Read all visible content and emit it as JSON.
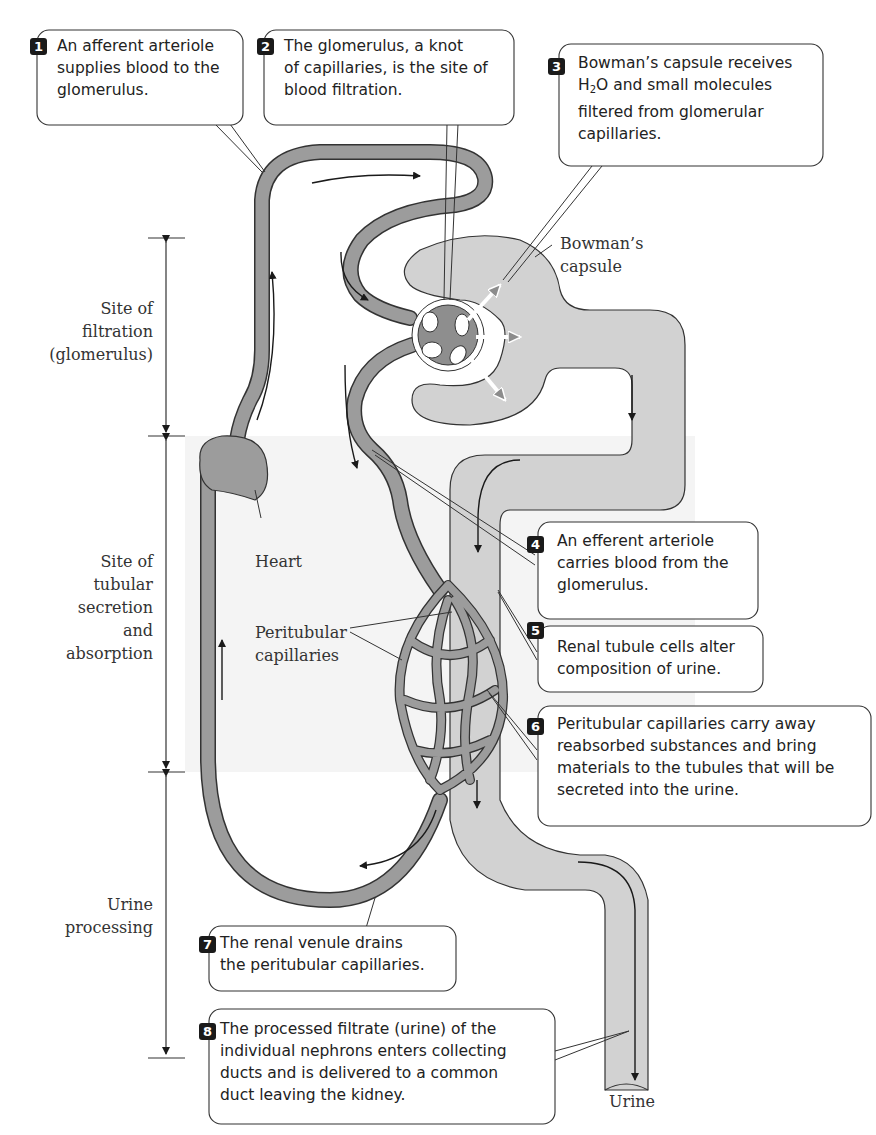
{
  "figure": {
    "colors": {
      "vessel": "#9a9a9a",
      "tubule": "#cfcfcf",
      "outline": "#333333",
      "background_shade": "#f3f3f3",
      "badge": "#1a1a1a"
    }
  },
  "callouts": [
    {
      "number": "1",
      "lines": [
        "An afferent arteriole",
        "supplies blood to the",
        "glomerulus."
      ]
    },
    {
      "number": "2",
      "lines": [
        "The glomerulus, a knot",
        "of capillaries, is the site of",
        "blood filtration."
      ]
    },
    {
      "number": "3",
      "lines": [
        "Bowman’s capsule receives",
        "H2O and small molecules",
        "filtered from glomerular",
        "capillaries."
      ]
    },
    {
      "number": "4",
      "lines": [
        "An efferent arteriole",
        "carries blood from the",
        "glomerulus."
      ]
    },
    {
      "number": "5",
      "lines": [
        "Renal tubule cells alter",
        "composition of urine."
      ]
    },
    {
      "number": "6",
      "lines": [
        "Peritubular capillaries carry away",
        "reabsorbed substances and bring",
        "materials to the tubules that will be",
        "secreted into the urine."
      ]
    },
    {
      "number": "7",
      "lines": [
        "The renal venule drains",
        "the peritubular capillaries."
      ]
    },
    {
      "number": "8",
      "lines": [
        "The processed filtrate (urine) of the",
        "individual nephrons enters collecting",
        "ducts and is delivered to a common",
        "duct leaving the kidney."
      ]
    }
  ],
  "h2o": {
    "h": "H",
    "sub": "2",
    "o": "O and small molecules"
  },
  "labels": {
    "bowmans": [
      "Bowman’s",
      "capsule"
    ],
    "heart": "Heart",
    "peritubular": [
      "Peritubular",
      "capillaries"
    ],
    "urine": "Urine"
  },
  "regions": [
    {
      "name": "filtration",
      "lines": [
        "Site of",
        "filtration",
        "(glomerulus)"
      ]
    },
    {
      "name": "secretion",
      "lines": [
        "Site of",
        "tubular",
        "secretion",
        "and",
        "absorption"
      ]
    },
    {
      "name": "urine",
      "lines": [
        "Urine",
        "processing"
      ]
    }
  ]
}
